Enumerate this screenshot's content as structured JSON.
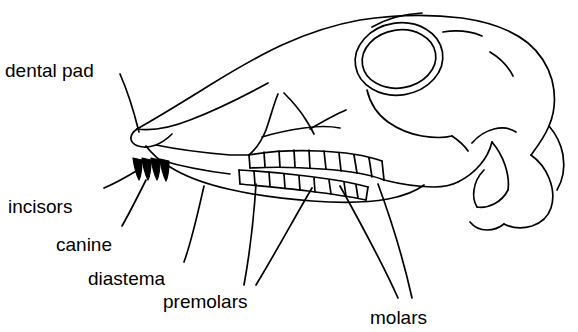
{
  "figure": {
    "type": "anatomical-line-drawing",
    "stroke_color": "#000000",
    "background_color": "#ffffff"
  },
  "labels": {
    "dental_pad": "dental pad",
    "incisors": "incisors",
    "canine": "canine",
    "diastema": "diastema",
    "premolars": "premolars",
    "molars": "molars"
  },
  "label_positions": {
    "dental_pad": {
      "x": 5,
      "y": 60
    },
    "incisors": {
      "x": 8,
      "y": 196
    },
    "canine": {
      "x": 56,
      "y": 234
    },
    "diastema": {
      "x": 88,
      "y": 268
    },
    "premolars": {
      "x": 163,
      "y": 291
    },
    "molars": {
      "x": 370,
      "y": 307
    }
  }
}
